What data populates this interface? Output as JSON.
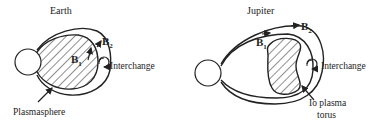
{
  "panels": [
    {
      "id": "earth",
      "title": "Earth",
      "field_labels": {
        "b1": "B",
        "b1_sub": "1",
        "b2": "B",
        "b2_sub": "2"
      },
      "interchange_label": "Interchange",
      "region_label": "Plasmasphere"
    },
    {
      "id": "jupiter",
      "title": "Jupiter",
      "field_labels": {
        "b1": "B",
        "b1_sub": "1",
        "b2": "B",
        "b2_sub": "2"
      },
      "interchange_label": "Interchange",
      "region_label_line1": "Io plasma",
      "region_label_line2": "torus"
    }
  ],
  "colors": {
    "ink": "#222222",
    "background": "#ffffff"
  }
}
